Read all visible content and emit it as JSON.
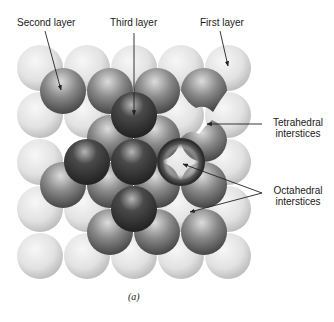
{
  "figure": {
    "caption": "(a)",
    "labels": {
      "second_layer": "Second layer",
      "third_layer": "Third layer",
      "first_layer": "First layer",
      "tetrahedral_line1": "Tetrahedral",
      "tetrahedral_line2": "interstices",
      "octahedral_line1": "Octahedral",
      "octahedral_line2": "interstices"
    },
    "colors": {
      "first_layer": "#e6e6e6",
      "second_layer": "#6e6e6e",
      "third_layer": "#3a3a3a",
      "text": "#1a1a1a"
    }
  }
}
